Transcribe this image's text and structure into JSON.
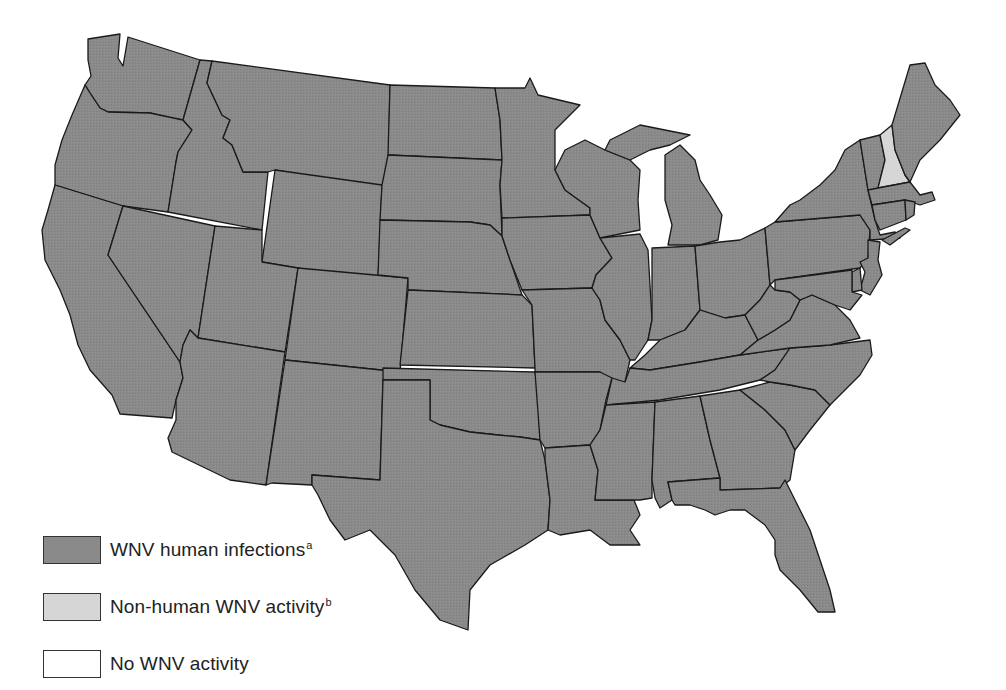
{
  "map": {
    "region": "Contiguous United States",
    "colors": {
      "human_infections": "#8a8a8a",
      "non_human_activity": "#d6d6d6",
      "no_activity": "#ffffff",
      "border": "#1a1a1a"
    },
    "states": [
      {
        "id": "WA",
        "status": "human_infections"
      },
      {
        "id": "OR",
        "status": "human_infections"
      },
      {
        "id": "CA",
        "status": "human_infections"
      },
      {
        "id": "ID",
        "status": "human_infections"
      },
      {
        "id": "NV",
        "status": "human_infections"
      },
      {
        "id": "MT",
        "status": "human_infections"
      },
      {
        "id": "WY",
        "status": "human_infections"
      },
      {
        "id": "UT",
        "status": "human_infections"
      },
      {
        "id": "AZ",
        "status": "human_infections"
      },
      {
        "id": "CO",
        "status": "human_infections"
      },
      {
        "id": "NM",
        "status": "human_infections"
      },
      {
        "id": "ND",
        "status": "human_infections"
      },
      {
        "id": "SD",
        "status": "human_infections"
      },
      {
        "id": "NE",
        "status": "human_infections"
      },
      {
        "id": "KS",
        "status": "human_infections"
      },
      {
        "id": "OK",
        "status": "human_infections"
      },
      {
        "id": "TX",
        "status": "human_infections"
      },
      {
        "id": "MN",
        "status": "human_infections"
      },
      {
        "id": "IA",
        "status": "human_infections"
      },
      {
        "id": "MO",
        "status": "human_infections"
      },
      {
        "id": "AR",
        "status": "human_infections"
      },
      {
        "id": "LA",
        "status": "human_infections"
      },
      {
        "id": "WI",
        "status": "human_infections"
      },
      {
        "id": "IL",
        "status": "human_infections"
      },
      {
        "id": "MI",
        "status": "human_infections"
      },
      {
        "id": "IN",
        "status": "human_infections"
      },
      {
        "id": "OH",
        "status": "human_infections"
      },
      {
        "id": "KY",
        "status": "human_infections"
      },
      {
        "id": "TN",
        "status": "human_infections"
      },
      {
        "id": "MS",
        "status": "human_infections"
      },
      {
        "id": "AL",
        "status": "human_infections"
      },
      {
        "id": "GA",
        "status": "human_infections"
      },
      {
        "id": "FL",
        "status": "human_infections"
      },
      {
        "id": "SC",
        "status": "human_infections"
      },
      {
        "id": "NC",
        "status": "human_infections"
      },
      {
        "id": "VA",
        "status": "human_infections"
      },
      {
        "id": "WV",
        "status": "human_infections"
      },
      {
        "id": "PA",
        "status": "human_infections"
      },
      {
        "id": "NY",
        "status": "human_infections"
      },
      {
        "id": "VT",
        "status": "human_infections"
      },
      {
        "id": "NH",
        "status": "non_human_activity"
      },
      {
        "id": "ME",
        "status": "human_infections"
      },
      {
        "id": "MA",
        "status": "human_infections"
      },
      {
        "id": "CT",
        "status": "human_infections"
      },
      {
        "id": "RI",
        "status": "human_infections"
      },
      {
        "id": "NJ",
        "status": "human_infections"
      },
      {
        "id": "DE",
        "status": "human_infections"
      },
      {
        "id": "MD",
        "status": "human_infections"
      }
    ]
  },
  "legend": {
    "items": [
      {
        "key": "human_infections",
        "label": "WNV human infections",
        "footnote": "a"
      },
      {
        "key": "non_human_activity",
        "label": "Non-human WNV activity",
        "footnote": "b"
      },
      {
        "key": "no_activity",
        "label": "No WNV activity",
        "footnote": ""
      }
    ]
  }
}
